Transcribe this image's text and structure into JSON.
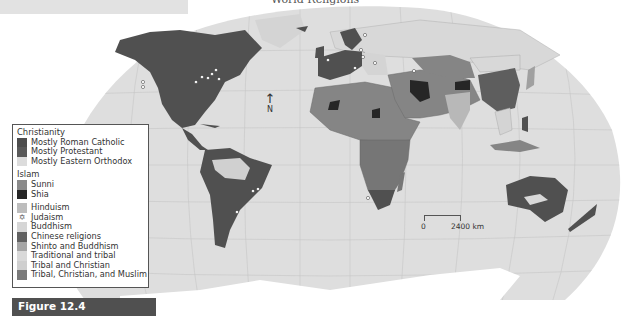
{
  "map": {
    "title": "World Religions",
    "north_label": "N",
    "north_arrow": "↑",
    "scale": {
      "start": "0",
      "end": "2400 km"
    }
  },
  "legend": {
    "groups": [
      {
        "heading": "Christianity",
        "items": [
          {
            "label": "Mostly Roman Catholic",
            "color": "#4d4d4d"
          },
          {
            "label": "Mostly Protestant",
            "color": "#595959"
          },
          {
            "label": "Mostly Eastern Orthodox",
            "color": "#dcdcdc"
          }
        ]
      },
      {
        "heading": "Islam",
        "items": [
          {
            "label": "Sunni",
            "color": "#8a8a8a"
          },
          {
            "label": "Shia",
            "color": "#262626"
          }
        ]
      },
      {
        "heading": "",
        "items": [
          {
            "label": "Hinduism",
            "color": "#bdbdbd"
          },
          {
            "label": "Judaism",
            "color": "",
            "icon": "star-of-david-icon",
            "glyph": "✡"
          },
          {
            "label": "Buddhism",
            "color": "#d6d6d6"
          },
          {
            "label": "Chinese religions",
            "color": "#616161"
          },
          {
            "label": "Shinto and Buddhism",
            "color": "#a6a6a6"
          },
          {
            "label": "Traditional and tribal",
            "color": "#d9d9d9"
          },
          {
            "label": "Tribal and Christian",
            "color": "#cfcfcf"
          },
          {
            "label": "Tribal, Christian, and Muslim",
            "color": "#7a7a7a"
          }
        ]
      }
    ]
  },
  "figure": {
    "label": "Figure 12.4"
  },
  "colors": {
    "ocean": "#dedede",
    "grid": "#c6c6c6",
    "catholic_protestant": "#505050",
    "sunni": "#858585",
    "shia": "#262626",
    "orthodox_buddhism": "#d4d4d4",
    "hinduism": "#b8b8b8",
    "chinese": "#5e5e5e",
    "shinto": "#a0a0a0",
    "tribal_mix": "#767676"
  }
}
